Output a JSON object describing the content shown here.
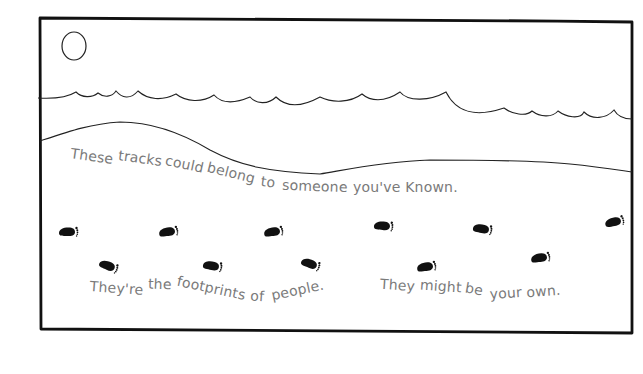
{
  "illustration": {
    "title": "Footprints in the sand",
    "colors": {
      "ink": "#111111",
      "text": "#7a7a7a",
      "paper": "#ffffff"
    },
    "elements": {
      "sun": "sun-circle",
      "waves": "ocean-wave-line",
      "shoreline": "sand-shoreline",
      "footprints": "footprint-icon"
    },
    "captions": {
      "line1": {
        "words": [
          "These",
          "tracks",
          "could",
          "belong",
          "to",
          "someone",
          "you've",
          "Known."
        ]
      },
      "line2": {
        "words": [
          "They're",
          "the",
          "footprints",
          "of",
          "people."
        ]
      },
      "line3": {
        "words": [
          "They",
          "might",
          "be",
          "your",
          "own."
        ]
      }
    },
    "footprints": [
      {
        "x": 68,
        "y": 232,
        "rot": 0
      },
      {
        "x": 108,
        "y": 266,
        "rot": 22
      },
      {
        "x": 168,
        "y": 232,
        "rot": -8
      },
      {
        "x": 212,
        "y": 266,
        "rot": 10
      },
      {
        "x": 273,
        "y": 232,
        "rot": -8
      },
      {
        "x": 310,
        "y": 264,
        "rot": 20
      },
      {
        "x": 383,
        "y": 226,
        "rot": 5
      },
      {
        "x": 426,
        "y": 267,
        "rot": -8
      },
      {
        "x": 482,
        "y": 229,
        "rot": 10
      },
      {
        "x": 540,
        "y": 258,
        "rot": -8
      },
      {
        "x": 614,
        "y": 222,
        "rot": -12
      }
    ]
  }
}
